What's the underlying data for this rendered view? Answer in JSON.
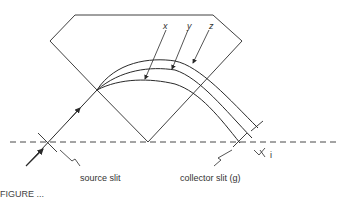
{
  "diagram": {
    "type": "mass spectrometer magnetic sector ion path",
    "labels": {
      "x": "x",
      "y": "y",
      "z": "z",
      "source_slit": "source slit",
      "collector_slit": "collector slit (g)",
      "i": "i"
    },
    "caption_partial": "FIGURE ..."
  },
  "colors": {
    "line": "#2a2a2a",
    "text": "#333333",
    "background": "#ffffff"
  }
}
